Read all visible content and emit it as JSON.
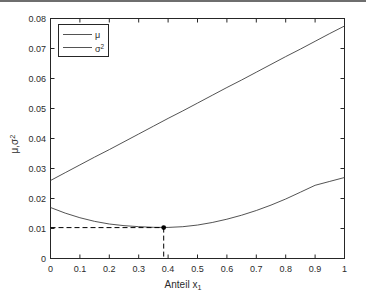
{
  "figure": {
    "background_color": "#ffffff",
    "axis_color": "#262626",
    "line_color": "#404040",
    "marker_color": "#000000",
    "top_rule_color": "#6e6e6e"
  },
  "chart_data": {
    "type": "line",
    "title": "",
    "xlabel": "Anteil x",
    "xlabel_sub": "1",
    "ylabel_mu": "μ",
    "ylabel_sep": ",",
    "ylabel_sigma": "σ",
    "ylabel_sigma_sup": "2",
    "xlim": [
      0,
      1
    ],
    "ylim": [
      0,
      0.08
    ],
    "grid": false,
    "legend_position": "upper left",
    "xticks": [
      0,
      0.1,
      0.2,
      0.3,
      0.4,
      0.5,
      0.6,
      0.7,
      0.8,
      0.9,
      1
    ],
    "xticklabels": [
      "0",
      "0.1",
      "0.2",
      "0.3",
      "0.4",
      "0.5",
      "0.6",
      "0.7",
      "0.8",
      "0.9",
      "1"
    ],
    "yticks": [
      0,
      0.01,
      0.02,
      0.03,
      0.04,
      0.05,
      0.06,
      0.07,
      0.08
    ],
    "yticklabels": [
      "0",
      "0.01",
      "0.02",
      "0.03",
      "0.04",
      "0.05",
      "0.06",
      "0.07",
      "0.08"
    ],
    "x": [
      0,
      0.05,
      0.1,
      0.15,
      0.2,
      0.25,
      0.3,
      0.35,
      0.4,
      0.45,
      0.5,
      0.55,
      0.6,
      0.65,
      0.7,
      0.75,
      0.8,
      0.85,
      0.9,
      0.95,
      1
    ],
    "series": [
      {
        "name": "μ",
        "legend_label": "μ",
        "values": [
          0.026,
          0.0286,
          0.0312,
          0.0338,
          0.0363,
          0.0389,
          0.0415,
          0.0441,
          0.0467,
          0.0492,
          0.0518,
          0.0544,
          0.057,
          0.0595,
          0.0621,
          0.0647,
          0.0673,
          0.0698,
          0.0724,
          0.075,
          0.0775
        ]
      },
      {
        "name": "σ²",
        "legend_label": "σ",
        "legend_label_sup": "2",
        "values": [
          0.017,
          0.01513,
          0.01359,
          0.01238,
          0.0115,
          0.01095,
          0.01061,
          0.0104,
          0.01036,
          0.0106,
          0.01115,
          0.012,
          0.0131,
          0.01443,
          0.016,
          0.0178,
          0.01983,
          0.0221,
          0.0244,
          0.0257,
          0.027
        ]
      }
    ],
    "annotations": [
      {
        "name": "minimum-marker",
        "type": "point",
        "x": 0.385,
        "y": 0.0103,
        "marker": "*",
        "guides": [
          "horizontal-dashed-to-y-axis",
          "vertical-dashed-to-x-axis"
        ]
      }
    ]
  }
}
